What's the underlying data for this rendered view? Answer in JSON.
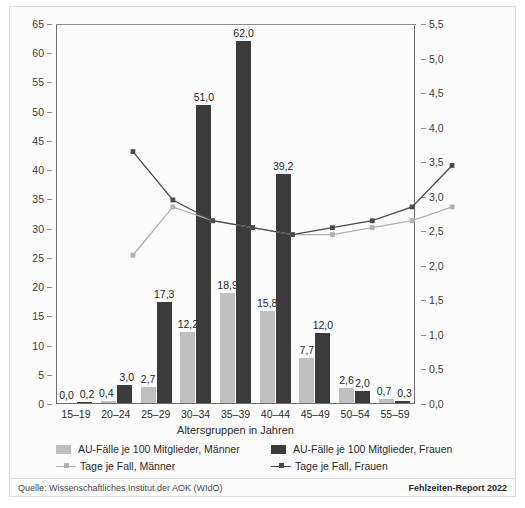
{
  "chart_data": {
    "type": "bar",
    "title": "",
    "xlabel": "Altersgruppen in Jahren",
    "ylabel": "",
    "categories": [
      "15–19",
      "20–24",
      "25–29",
      "30–34",
      "35–39",
      "40–44",
      "45–49",
      "50–54",
      "55–59"
    ],
    "ylim": [
      0,
      65
    ],
    "y2lim": [
      0.0,
      5.5
    ],
    "yticks": [
      "0",
      "5",
      "10",
      "15",
      "20",
      "25",
      "30",
      "35",
      "40",
      "45",
      "50",
      "55",
      "60",
      "65"
    ],
    "y2ticks": [
      "0,0",
      "0,5",
      "1,0",
      "1,5",
      "2,0",
      "2,5",
      "3,0",
      "3,5",
      "4,0",
      "4,5",
      "5,0",
      "5,5"
    ],
    "grid": false,
    "legend_position": "bottom",
    "series": [
      {
        "name": "AU-Fälle je 100 Mitglieder, Männer",
        "kind": "bar",
        "axis": "left",
        "color": "#bfbfbf",
        "values": [
          0.0,
          0.4,
          2.7,
          12.2,
          18.9,
          15.8,
          7.7,
          2.6,
          0.7
        ],
        "labels": [
          "0,0",
          "0,4",
          "2,7",
          "12,2",
          "18,9",
          "15,8",
          "7,7",
          "2,6",
          "0,7"
        ]
      },
      {
        "name": "AU-Fälle je 100 Mitglieder, Frauen",
        "kind": "bar",
        "axis": "left",
        "color": "#3b3b3b",
        "values": [
          0.2,
          3.0,
          17.3,
          51.0,
          62.0,
          39.2,
          12.0,
          2.0,
          0.3
        ],
        "labels": [
          "0,2",
          "3,0",
          "17,3",
          "51,0",
          "62,0",
          "39,2",
          "12,0",
          "2,0",
          "0,3"
        ]
      },
      {
        "name": "Tage je Fall, Männer",
        "kind": "line",
        "axis": "right",
        "color": "#b0b0b0",
        "values": [
          2.5,
          3.2,
          3.0,
          2.9,
          2.8,
          2.8,
          2.9,
          3.0,
          3.2
        ]
      },
      {
        "name": "Tage je Fall, Frauen",
        "kind": "line",
        "axis": "right",
        "color": "#4a4a4a",
        "values": [
          4.0,
          3.3,
          3.0,
          2.9,
          2.8,
          2.9,
          3.0,
          3.2,
          3.8
        ]
      }
    ]
  },
  "legend": {
    "items": [
      {
        "label": "AU-Fälle je 100 Mitglieder, Männer",
        "marker": "bar",
        "color": "#bfbfbf"
      },
      {
        "label": "AU-Fälle je 100 Mitglieder, Frauen",
        "marker": "bar",
        "color": "#3b3b3b"
      },
      {
        "label": "Tage je Fall, Männer",
        "marker": "line",
        "color": "#b0b0b0"
      },
      {
        "label": "Tage je Fall, Frauen",
        "marker": "line",
        "color": "#4a4a4a"
      }
    ]
  },
  "footer": {
    "source": "Quelle: Wissenschaftliches Institut der AOK (WIdO)",
    "report": "Fehlzeiten-Report 2022"
  }
}
